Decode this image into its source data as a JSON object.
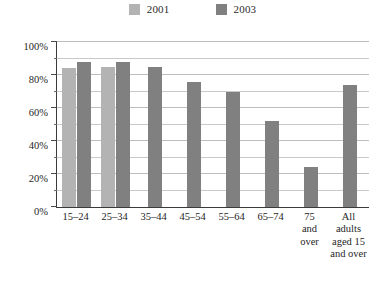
{
  "legend": {
    "entries": [
      {
        "label": "2001",
        "color": "#b3b3b3",
        "swatch_name": "legend-swatch-2001"
      },
      {
        "label": "2003",
        "color": "#808080",
        "swatch_name": "legend-swatch-2003"
      }
    ]
  },
  "axis": {
    "y_ticks": [
      "0%",
      "20%",
      "40%",
      "60%",
      "80%",
      "100%"
    ]
  },
  "chart_data": {
    "type": "bar",
    "title": "",
    "subtitle": "",
    "xlabel": "",
    "ylabel": "",
    "ylim": [
      0,
      100
    ],
    "y_ticks": [
      0,
      20,
      40,
      60,
      80,
      100
    ],
    "y_minor_ticks": [
      10,
      30,
      50,
      70,
      90
    ],
    "y_tick_labels": [
      "0%",
      "20%",
      "40%",
      "60%",
      "80%",
      "100%"
    ],
    "grid": true,
    "grid_axis": "y",
    "legend_position": "top-center",
    "categories": [
      "15–24",
      "25–34",
      "35–44",
      "45–54",
      "55–64",
      "65–74",
      "75\nand\nover",
      "All\nadults\naged 15\nand over"
    ],
    "category_labels_flat": [
      "15-24",
      "25-34",
      "35-44",
      "45-54",
      "55-64",
      "65-74",
      "75 and over",
      "All adults aged 15 and over"
    ],
    "series": [
      {
        "name": "2001",
        "color": "#b3b3b3",
        "values": [
          84,
          85,
          null,
          null,
          null,
          null,
          null,
          null
        ]
      },
      {
        "name": "2003",
        "color": "#808080",
        "values": [
          88,
          88,
          85,
          76,
          70,
          52,
          24,
          74
        ]
      }
    ]
  }
}
